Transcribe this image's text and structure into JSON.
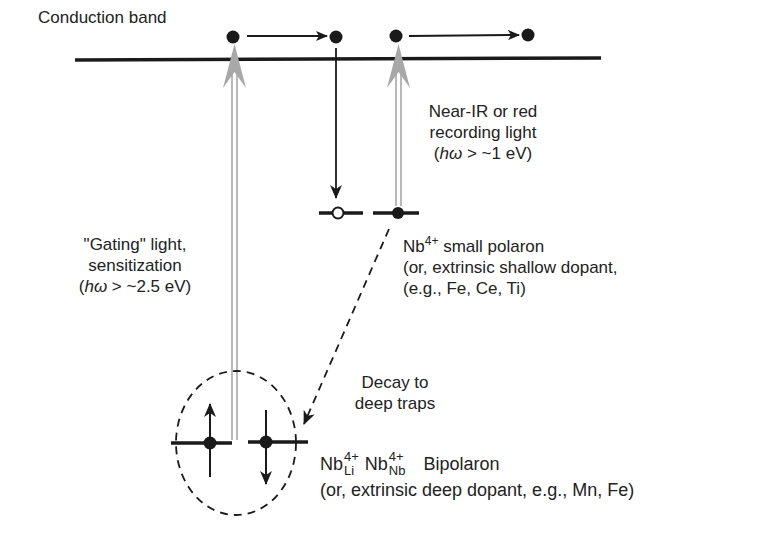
{
  "diagram": {
    "conduction_band_label": "Conduction band",
    "gating_light": {
      "line1": "\"Gating\" light,",
      "line2": "sensitization",
      "energy_prefix": "(",
      "energy_symbol": "hω",
      "energy_suffix": " > ~2.5 eV)"
    },
    "recording_light": {
      "line1": "Near-IR or red",
      "line2": "recording light",
      "energy_prefix": "(",
      "energy_symbol": "hω",
      "energy_suffix": " > ~1 eV)"
    },
    "small_polaron": {
      "species": "Nb",
      "charge": "4+",
      "title_suffix": " small polaron",
      "line2": "(or, extrinsic shallow dopant,",
      "line3": "(e.g., Fe, Ce, Ti)"
    },
    "decay": {
      "line1": "Decay to",
      "line2": "deep traps"
    },
    "bipolaron": {
      "species1": "Nb",
      "charge1": "4+",
      "site1": "Li",
      "species2": "Nb",
      "charge2": "4+",
      "site2": "Nb",
      "name": "Bipolaron",
      "line2": "(or, extrinsic deep dopant, e.g., Mn, Fe)"
    },
    "colors": {
      "ink": "#1a1a1a",
      "gray_arrow": "#a8a8a8",
      "background": "#ffffff"
    }
  }
}
